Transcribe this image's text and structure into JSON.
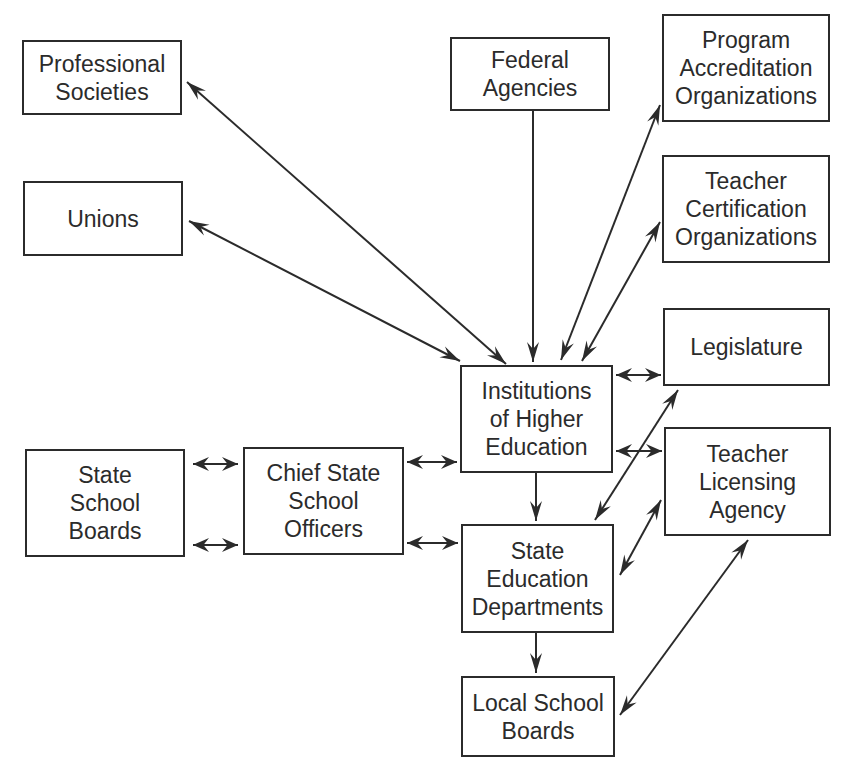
{
  "diagram": {
    "colors": {
      "line": "#2b2b2b",
      "background": "#ffffff"
    },
    "nodes": [
      {
        "id": "professional-societies",
        "label": "Professional\nSocieties",
        "x": 22,
        "y": 40,
        "w": 160,
        "h": 75
      },
      {
        "id": "unions",
        "label": "Unions",
        "x": 23,
        "y": 181,
        "w": 160,
        "h": 75
      },
      {
        "id": "federal-agencies",
        "label": "Federal\nAgencies",
        "x": 450,
        "y": 37,
        "w": 160,
        "h": 74
      },
      {
        "id": "program-accreditation-organizations",
        "label": "Program\nAccreditation\nOrganizations",
        "x": 662,
        "y": 14,
        "w": 168,
        "h": 108
      },
      {
        "id": "teacher-certification-organizations",
        "label": "Teacher\nCertification\nOrganizations",
        "x": 662,
        "y": 155,
        "w": 168,
        "h": 108
      },
      {
        "id": "legislature",
        "label": "Legislature",
        "x": 663,
        "y": 308,
        "w": 167,
        "h": 78
      },
      {
        "id": "institutions-of-higher-education",
        "label": "Institutions\nof Higher\nEducation",
        "x": 460,
        "y": 365,
        "w": 153,
        "h": 108
      },
      {
        "id": "teacher-licensing-agency",
        "label": "Teacher\nLicensing\nAgency",
        "x": 664,
        "y": 427,
        "w": 167,
        "h": 109
      },
      {
        "id": "state-school-boards",
        "label": "State\nSchool\nBoards",
        "x": 25,
        "y": 449,
        "w": 160,
        "h": 108
      },
      {
        "id": "chief-state-school-officers",
        "label": "Chief State\nSchool\nOfficers",
        "x": 243,
        "y": 447,
        "w": 161,
        "h": 108
      },
      {
        "id": "state-education-departments",
        "label": "State\nEducation\nDepartments",
        "x": 461,
        "y": 524,
        "w": 153,
        "h": 109
      },
      {
        "id": "local-school-boards",
        "label": "Local School\nBoards",
        "x": 461,
        "y": 676,
        "w": 154,
        "h": 81
      }
    ],
    "edges": [
      {
        "from": "institutions-of-higher-education",
        "to": "professional-societies",
        "type": "bidirectional",
        "x1": 506,
        "y1": 364,
        "x2": 187,
        "y2": 82
      },
      {
        "from": "institutions-of-higher-education",
        "to": "unions",
        "type": "bidirectional",
        "x1": 460,
        "y1": 361,
        "x2": 189,
        "y2": 221
      },
      {
        "from": "federal-agencies",
        "to": "institutions-of-higher-education",
        "type": "directed",
        "x1": 533,
        "y1": 111,
        "x2": 533,
        "y2": 362
      },
      {
        "from": "institutions-of-higher-education",
        "to": "program-accreditation-organizations",
        "type": "bidirectional",
        "x1": 561,
        "y1": 360,
        "x2": 660,
        "y2": 105
      },
      {
        "from": "institutions-of-higher-education",
        "to": "teacher-certification-organizations",
        "type": "bidirectional",
        "x1": 582,
        "y1": 361,
        "x2": 660,
        "y2": 222
      },
      {
        "from": "institutions-of-higher-education",
        "to": "legislature",
        "type": "bidirectional-short",
        "x1": 616,
        "y1": 375,
        "x2": 661,
        "y2": 375
      },
      {
        "from": "institutions-of-higher-education",
        "to": "teacher-licensing-agency",
        "type": "bidirectional-short",
        "x1": 616,
        "y1": 451,
        "x2": 662,
        "y2": 451
      },
      {
        "from": "legislature",
        "to": "state-education-departments",
        "type": "bidirectional",
        "x1": 678,
        "y1": 390,
        "x2": 595,
        "y2": 520
      },
      {
        "from": "teacher-licensing-agency",
        "to": "state-education-departments",
        "type": "bidirectional",
        "x1": 661,
        "y1": 500,
        "x2": 620,
        "y2": 575
      },
      {
        "from": "teacher-licensing-agency",
        "to": "local-school-boards",
        "type": "bidirectional",
        "x1": 748,
        "y1": 540,
        "x2": 620,
        "y2": 715
      },
      {
        "from": "institutions-of-higher-education",
        "to": "state-education-departments",
        "type": "directed",
        "x1": 536,
        "y1": 473,
        "x2": 536,
        "y2": 521
      },
      {
        "from": "state-education-departments",
        "to": "local-school-boards",
        "type": "directed",
        "x1": 536,
        "y1": 633,
        "x2": 536,
        "y2": 673
      },
      {
        "from": "state-school-boards",
        "to": "chief-state-school-officers",
        "type": "bidirectional-short",
        "x1": 193,
        "y1": 464,
        "x2": 238,
        "y2": 464
      },
      {
        "from": "state-school-boards",
        "to": "chief-state-school-officers",
        "type": "bidirectional-short",
        "x1": 193,
        "y1": 545,
        "x2": 238,
        "y2": 545
      },
      {
        "from": "chief-state-school-officers",
        "to": "institutions-of-higher-education",
        "type": "bidirectional-short",
        "x1": 407,
        "y1": 462,
        "x2": 457,
        "y2": 462
      },
      {
        "from": "chief-state-school-officers",
        "to": "state-education-departments",
        "type": "bidirectional-short",
        "x1": 407,
        "y1": 543,
        "x2": 458,
        "y2": 543
      }
    ]
  }
}
